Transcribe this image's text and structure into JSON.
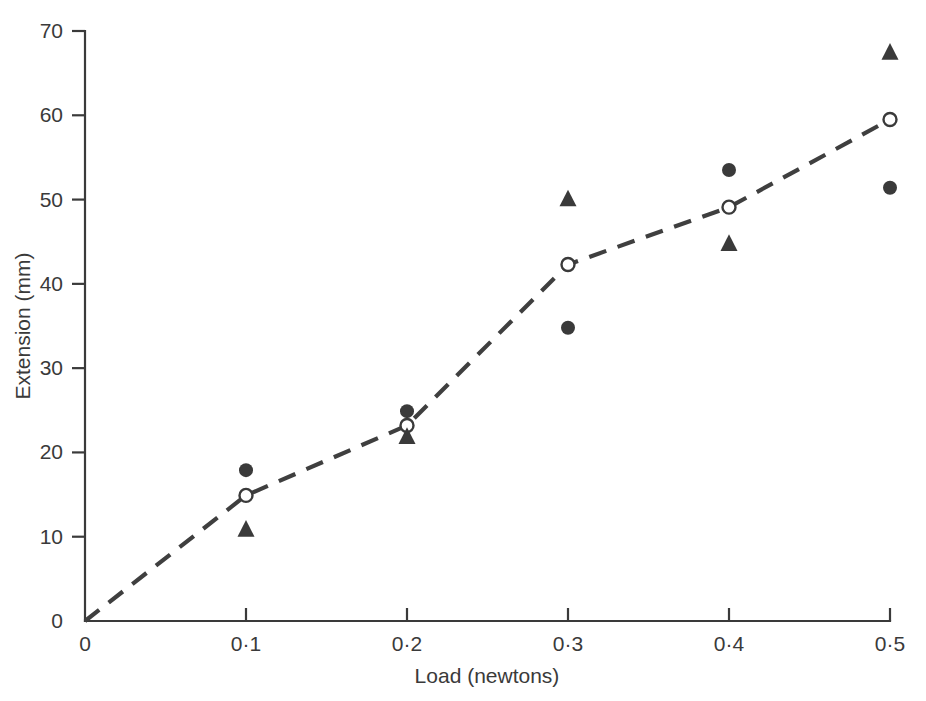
{
  "chart_data": {
    "type": "scatter",
    "title": "",
    "xlabel": "Load (newtons)",
    "ylabel": "Extension (mm)",
    "xlim": [
      0,
      0.5
    ],
    "ylim": [
      0,
      70
    ],
    "grid": false,
    "legend": "none",
    "x_tick_labels": [
      "0",
      "0·1",
      "0·2",
      "0·3",
      "0·4",
      "0·5"
    ],
    "x_tick_values": [
      0,
      0.1,
      0.2,
      0.3,
      0.4,
      0.5
    ],
    "y_tick_labels": [
      "0",
      "10",
      "20",
      "30",
      "40",
      "50",
      "60",
      "70"
    ],
    "y_tick_values": [
      0,
      10,
      20,
      30,
      40,
      50,
      60,
      70
    ],
    "x": [
      0.1,
      0.2,
      0.3,
      0.4,
      0.5
    ],
    "series": [
      {
        "name": "filled-circle",
        "marker": "filled-circle",
        "connected": false,
        "values": [
          17.9,
          24.9,
          34.8,
          53.5,
          51.4
        ]
      },
      {
        "name": "open-circle-mean",
        "marker": "open-circle",
        "connected": true,
        "line_style": "dashed",
        "origin_point": {
          "x": 0,
          "y": 0
        },
        "values": [
          14.9,
          23.2,
          42.3,
          49.1,
          59.5
        ]
      },
      {
        "name": "triangle",
        "marker": "triangle",
        "connected": false,
        "values": [
          10.8,
          21.8,
          50.0,
          44.7,
          67.4
        ]
      }
    ],
    "colors": {
      "marker": "#3a3a3a",
      "line": "#3f3f3f",
      "axis": "#3a3a3a",
      "background": "#ffffff"
    }
  },
  "axes": {
    "x_title": "Load (newtons)",
    "y_title": "Extension (mm)"
  }
}
